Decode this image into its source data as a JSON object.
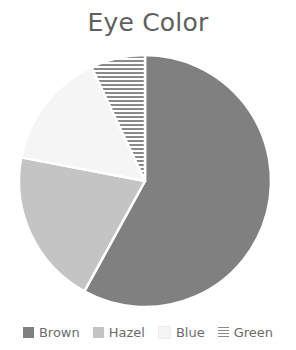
{
  "title": "Eye Color",
  "colors": {
    "background": "#ffffff",
    "title_text": "#5f5f5f",
    "legend_text": "#6b6b6b",
    "brown": "#808080",
    "hazel": "#c4c4c4",
    "blue": "#f5f5f5",
    "green_hatch_line": "#8a8a8a",
    "green_hatch_bg": "#ffffff",
    "slice_border": "#ffffff"
  },
  "pie_geometry": {
    "center_x": 145,
    "center_y": 137,
    "radius": 126
  },
  "legend": {
    "items": [
      {
        "label": "Brown",
        "swatch": "brown-swatch-icon",
        "fill": "#808080",
        "pattern": "solid"
      },
      {
        "label": "Hazel",
        "swatch": "hazel-swatch-icon",
        "fill": "#c4c4c4",
        "pattern": "solid"
      },
      {
        "label": "Blue",
        "swatch": "blue-swatch-icon",
        "fill": "#f5f5f5",
        "pattern": "solid"
      },
      {
        "label": "Green",
        "swatch": "green-swatch-icon",
        "fill": "#ffffff",
        "pattern": "horizontal-hatch"
      }
    ]
  },
  "chart_data": {
    "type": "pie",
    "title": "Eye Color",
    "xlabel": "",
    "ylabel": "",
    "legend_position": "bottom",
    "start_angle_deg": 0,
    "direction": "clockwise",
    "categories": [
      "Brown",
      "Hazel",
      "Blue",
      "Green"
    ],
    "values": [
      58,
      20,
      15,
      7
    ],
    "units": "percent",
    "slices": [
      {
        "label": "Brown",
        "value": 58,
        "start_deg": 0,
        "end_deg": 208.8,
        "fill": "#808080",
        "pattern": "solid"
      },
      {
        "label": "Hazel",
        "value": 20,
        "start_deg": 208.8,
        "end_deg": 280.8,
        "fill": "#c4c4c4",
        "pattern": "solid"
      },
      {
        "label": "Blue",
        "value": 15,
        "start_deg": 280.8,
        "end_deg": 334.8,
        "fill": "#f5f5f5",
        "pattern": "solid"
      },
      {
        "label": "Green",
        "value": 7,
        "start_deg": 334.8,
        "end_deg": 360.0,
        "fill": "#ffffff",
        "pattern": "horizontal-hatch"
      }
    ]
  }
}
